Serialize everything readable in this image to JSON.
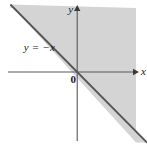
{
  "figure": {
    "title": "",
    "background_color": "#ffffff"
  },
  "labels": {
    "y_axis": "y",
    "x_axis": "x",
    "origin": "0",
    "line_equation": "y = −x"
  },
  "colors": {
    "shaded_region": "#d4d4d4",
    "line": "#555555",
    "axis": "#595959",
    "text": "#1a1a1a",
    "unshaded_region": "#ffffff"
  },
  "chart_data": {
    "type": "line",
    "title": "",
    "xlabel": "x",
    "ylabel": "y",
    "grid": false,
    "legend": "none",
    "xlim": [
      -5.2,
      4.7
    ],
    "ylim": [
      -5.2,
      4.8
    ],
    "annotations": [
      {
        "text": "y = −x",
        "x": -3.6,
        "y": 1.6
      },
      {
        "text": "0",
        "x": -0.45,
        "y": -0.55
      }
    ],
    "series": [
      {
        "name": "y = -x",
        "type": "line",
        "equation": "y = -x",
        "slope": -1,
        "intercept": 0,
        "x": [
          -4.5,
          4.7
        ],
        "values": [
          4.5,
          -4.7
        ],
        "style": "solid",
        "color": "#555555"
      }
    ],
    "shaded_regions": [
      {
        "name": "y >= -x",
        "inequality": "y ≥ −x",
        "description": "Half-plane above and to the right of the line y = -x",
        "color": "#d4d4d4"
      }
    ],
    "axes": [
      {
        "name": "x-axis",
        "orientation": "horizontal",
        "arrow": "right",
        "label": "x"
      },
      {
        "name": "y-axis",
        "orientation": "vertical",
        "arrow": "up",
        "label": "y"
      }
    ]
  }
}
